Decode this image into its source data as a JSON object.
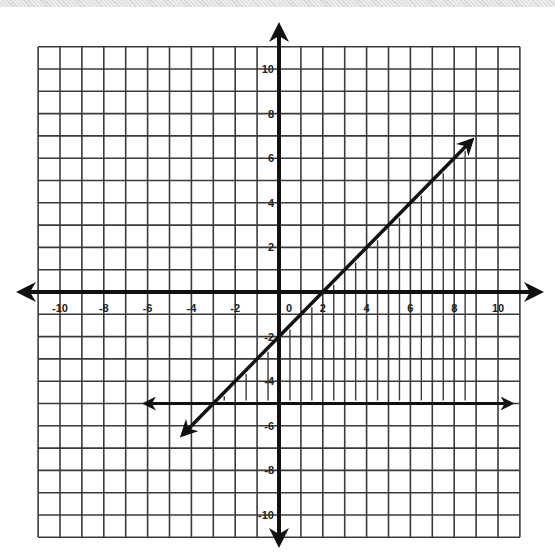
{
  "chart_data": {
    "type": "line",
    "title": "",
    "xlabel": "",
    "ylabel": "",
    "xlim": [
      -11,
      11
    ],
    "ylim": [
      -11,
      11
    ],
    "grid": true,
    "grid_step": 1,
    "x_tick_labels": [
      "-10",
      "-8",
      "-6",
      "-4",
      "-2",
      "0",
      "2",
      "4",
      "6",
      "8",
      "10"
    ],
    "x_tick_values": [
      -10,
      -8,
      -6,
      -4,
      -2,
      0,
      2,
      4,
      6,
      8,
      10
    ],
    "y_tick_labels": [
      "10",
      "8",
      "6",
      "4",
      "2",
      "-2",
      "-4",
      "-6",
      "-8",
      "-10"
    ],
    "y_tick_values": [
      10,
      8,
      6,
      4,
      2,
      -2,
      -4,
      -6,
      -8,
      -10
    ],
    "series": [
      {
        "name": "y = x - 2",
        "style": "solid-arrows",
        "x": [
          -4.3,
          8.7
        ],
        "y": [
          -6.3,
          6.7
        ]
      },
      {
        "name": "y = -5",
        "style": "solid-arrows",
        "x": [
          -6,
          10.5
        ],
        "y": [
          -5,
          -5
        ]
      }
    ],
    "shaded_region": {
      "description": "y <= x - 2 and y >= -5 (vertical hatching)",
      "hatch_x": [
        -2.5,
        -1.5,
        -0.5,
        0.5,
        1.5,
        2.5,
        3.5,
        4.5,
        5.5,
        6.5,
        7.5,
        8.5
      ],
      "lower_bound": -5,
      "upper_bound_line": "y = x - 2"
    },
    "annotations": []
  },
  "colors": {
    "grid": "#3a3a3a",
    "axis": "#111111",
    "line": "#111111",
    "hatch": "#3a3a3a",
    "background": "#ffffff"
  }
}
